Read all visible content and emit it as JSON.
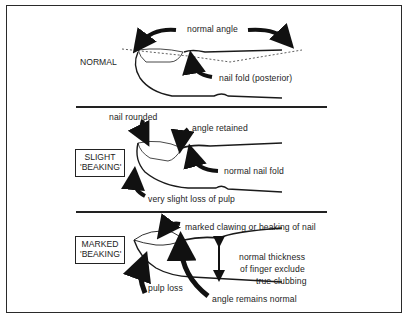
{
  "figure": {
    "panels": [
      {
        "id": "normal",
        "tag": "NORMAL",
        "tag_boxed": false,
        "annotations": [
          "normal angle",
          "nail fold (posterior)"
        ]
      },
      {
        "id": "slight",
        "tag_line1": "SLIGHT",
        "tag_line2": "'BEAKING'",
        "tag_boxed": true,
        "annotations": [
          "nail rounded",
          "angle retained",
          "normal nail fold",
          "very slight loss of pulp"
        ]
      },
      {
        "id": "marked",
        "tag_line1": "MARKED",
        "tag_line2": "'BEAKING'",
        "tag_boxed": true,
        "annotations": [
          "marked clawing or beaking of nail",
          "normal thickness",
          "of finger exclude",
          "true clubbing",
          "pulp loss",
          "angle remains normal"
        ]
      }
    ]
  },
  "colors": {
    "ink": "#1c1c1c",
    "background": "#ffffff"
  }
}
